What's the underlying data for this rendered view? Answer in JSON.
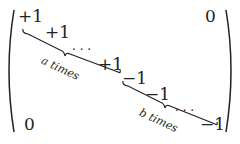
{
  "matrix": {
    "plus": "+1",
    "minus": "−1",
    "zero": "0",
    "dots": ". . .",
    "label_a": "a times",
    "label_b": "b times"
  }
}
